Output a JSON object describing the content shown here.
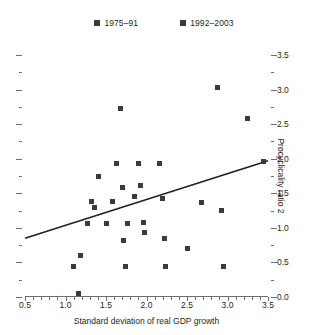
{
  "legend": {
    "entries": [
      {
        "label": "1975–91",
        "color": "#3b3b3d",
        "name": "series-1975-91"
      },
      {
        "label": "1992–2003",
        "color": "#3b3b3d",
        "name": "series-1992-2003"
      }
    ]
  },
  "axes": {
    "x_title": "Standard deviation of real GDP growth",
    "y_title": "Procyclicality ratio 2",
    "x_ticks": [
      "0.5",
      "1.0",
      "1.5",
      "2.0",
      "2.5",
      "3.0",
      "3.5"
    ],
    "y_ticks": [
      "0.0",
      "0.5",
      "1.0",
      "1.5",
      "2.0",
      "2.5",
      "3.0",
      "3.5"
    ],
    "axis_color": "#6d6e70"
  },
  "chart_data": {
    "type": "scatter",
    "title": "",
    "xlabel": "Standard deviation of real GDP growth",
    "ylabel": "Procyclicality ratio 2",
    "xlim": [
      0.5,
      3.5
    ],
    "ylim": [
      0.0,
      3.5
    ],
    "xticks": [
      0.5,
      1.0,
      1.5,
      2.0,
      2.5,
      3.0,
      3.5
    ],
    "yticks": [
      0.0,
      0.5,
      1.0,
      1.5,
      2.0,
      2.5,
      3.0,
      3.5
    ],
    "x_minor_step": 0.1,
    "y_minor_step": 0.25,
    "grid": false,
    "legend_position": "top-center",
    "marker": "square",
    "marker_color": "#3b3b3d",
    "series": [
      {
        "name": "1975–91",
        "color": "#3b3b3d",
        "points": [
          [
            1.1,
            0.44
          ],
          [
            1.16,
            0.05
          ],
          [
            1.19,
            0.6
          ],
          [
            1.27,
            1.07
          ],
          [
            1.32,
            1.38
          ],
          [
            1.36,
            1.3
          ],
          [
            1.41,
            1.74
          ],
          [
            1.5,
            1.07
          ],
          [
            1.58,
            1.38
          ],
          [
            1.63,
            1.93
          ],
          [
            1.68,
            2.72
          ],
          [
            1.7,
            1.59
          ],
          [
            1.72,
            0.82
          ],
          [
            1.74,
            0.44
          ],
          [
            1.76,
            1.07
          ]
        ]
      },
      {
        "name": "1992–2003",
        "color": "#3b3b3d",
        "points": [
          [
            1.85,
            1.46
          ],
          [
            1.9,
            1.93
          ],
          [
            1.93,
            1.61
          ],
          [
            1.96,
            1.08
          ],
          [
            1.98,
            0.93
          ],
          [
            2.16,
            1.93
          ],
          [
            2.2,
            1.42
          ],
          [
            2.22,
            0.84
          ],
          [
            2.24,
            0.44
          ],
          [
            2.5,
            0.7
          ],
          [
            2.68,
            1.37
          ],
          [
            2.88,
            3.03
          ],
          [
            2.92,
            1.25
          ],
          [
            2.95,
            0.44
          ],
          [
            3.25,
            2.58
          ],
          [
            3.45,
            1.96
          ]
        ]
      }
    ],
    "trendline": {
      "x_start": 0.5,
      "y_start": 0.85,
      "x_end": 3.5,
      "y_end": 1.97,
      "color": "#231f20"
    }
  }
}
